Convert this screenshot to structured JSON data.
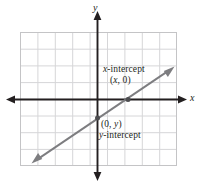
{
  "figure": {
    "name": "linear-graph-intercepts",
    "width": 203,
    "height": 185,
    "background": "#ffffff"
  },
  "axes": {
    "x_label": "x",
    "y_label": "y",
    "x_axis_y": 99,
    "y_axis_x": 97,
    "color": "#231f20",
    "arrow_tips": {
      "left": 7,
      "right": 186,
      "top": 12,
      "bottom": 180
    }
  },
  "grid": {
    "left": 20,
    "top": 32,
    "right": 177,
    "bottom": 166,
    "columns": 9,
    "rows": 8,
    "cell_size": 17.4,
    "color": "#d4d4d6",
    "border_color": "#bdbdbf"
  },
  "line": {
    "color": "#7d7d80",
    "x1": 32,
    "y1": 163,
    "x2": 174,
    "y2": 67,
    "double_arrow": true
  },
  "points": [
    {
      "name": "x-intercept-point",
      "x": 128,
      "y": 99,
      "label_name": "x-intercept",
      "label_coord_open": "(",
      "label_coord_var": "x",
      "label_coord_rest": ", 0)"
    },
    {
      "name": "y-intercept-point",
      "x": 97,
      "y": 118,
      "label_name": "y-intercept",
      "label_coord_open": "(0, ",
      "label_coord_var": "y",
      "label_coord_rest": ")"
    }
  ],
  "labels": {
    "x_intercept_prefix": "x",
    "x_intercept_suffix": "-intercept",
    "x_intercept_coord_open": "(",
    "x_intercept_coord_var": "x",
    "x_intercept_coord_close": ", 0)",
    "y_intercept_prefix": "y",
    "y_intercept_suffix": "-intercept",
    "y_intercept_coord_open": "(0, ",
    "y_intercept_coord_var": "y",
    "y_intercept_coord_close": ")"
  }
}
